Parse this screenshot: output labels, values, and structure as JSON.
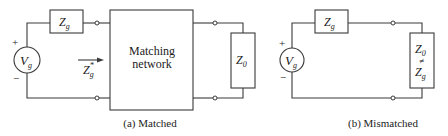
{
  "diagram": {
    "type": "circuit-schematic",
    "colors": {
      "line": "#3a3a3a",
      "text": "#222222",
      "background": "#ffffff"
    },
    "matched": {
      "caption": "(a) Matched",
      "source": {
        "label": "V",
        "subscript": "g",
        "plus": "+",
        "minus": "−"
      },
      "generator_impedance": {
        "label": "Z",
        "subscript": "g"
      },
      "matching_network": {
        "line1": "Matching",
        "line2": "network"
      },
      "input_impedance": {
        "label": "Z",
        "subscript": "g",
        "superscript": "*",
        "arrow": "right"
      },
      "load": {
        "label": "Z",
        "subscript": "0"
      }
    },
    "mismatched": {
      "caption": "(b) Mismatched",
      "source": {
        "label": "V",
        "subscript": "g",
        "plus": "+",
        "minus": "−"
      },
      "generator_impedance": {
        "label": "Z",
        "subscript": "g"
      },
      "load": {
        "top": {
          "label": "Z",
          "subscript": "0"
        },
        "relation": "≠",
        "bottom": {
          "label": "Z",
          "subscript": "g"
        }
      }
    }
  }
}
